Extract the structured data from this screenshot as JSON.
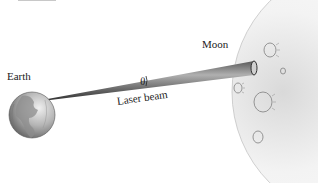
{
  "figure": {
    "labels": {
      "earth": "Earth",
      "moon": "Moon",
      "beam": "Laser beam",
      "angle": "θ"
    },
    "colors": {
      "background": "#ffffff",
      "earth_light": "#e6e6e6",
      "earth_dark": "#6e6e6e",
      "moon_fill": "#f2f2f2",
      "moon_edge": "#bdbdbd",
      "beam_light": "#9a9a9a",
      "beam_dark": "#3a3a3a",
      "crater": "#8a8a8a"
    },
    "earth": {
      "cx": 32,
      "cy": 115,
      "r": 23
    },
    "moon": {
      "cx": 360,
      "cy": 92,
      "r": 128
    },
    "beam": {
      "start": [
        42,
        100
      ],
      "end_top": [
        254,
        61
      ],
      "end_bottom": [
        254,
        75
      ]
    },
    "craters": [
      {
        "cx": 270,
        "cy": 50,
        "r": 7
      },
      {
        "cx": 283,
        "cy": 71,
        "r": 3
      },
      {
        "cx": 238,
        "cy": 88,
        "r": 5
      },
      {
        "cx": 263,
        "cy": 102,
        "r": 10
      },
      {
        "cx": 258,
        "cy": 137,
        "r": 6
      }
    ]
  }
}
